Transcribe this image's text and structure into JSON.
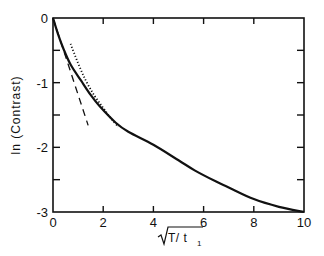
{
  "chart_data": {
    "type": "line",
    "title": "",
    "xlabel": "√(T/t₁)",
    "xlabel_parts": {
      "radicand_main": "T/ t",
      "subscript": "1"
    },
    "ylabel": "ln (Contrast)",
    "xlim": [
      0,
      10
    ],
    "ylim": [
      -3,
      0
    ],
    "x_ticks": [
      0,
      2,
      4,
      6,
      8,
      10
    ],
    "x_tick_labels": [
      "0",
      "2",
      "4",
      "6",
      "8",
      "10"
    ],
    "y_ticks": [
      0,
      -1,
      -2,
      -3
    ],
    "y_tick_labels": [
      "0",
      "-1",
      "-2",
      "-3"
    ],
    "y_minor_ticks": [
      -0.5,
      -1.5,
      -2.5
    ],
    "grid": false,
    "legend": null,
    "series": [
      {
        "name": "full solution",
        "style": "solid",
        "color": "#111111",
        "x": [
          0,
          0.2,
          0.4,
          0.7,
          1.12,
          1.5,
          1.87,
          2.5,
          3.0,
          4.0,
          5.0,
          5.66,
          6.5,
          7.0,
          8.0,
          9.0,
          10.0
        ],
        "y": [
          0,
          -0.25,
          -0.46,
          -0.72,
          -0.97,
          -1.19,
          -1.37,
          -1.62,
          -1.76,
          -1.96,
          -2.2,
          -2.36,
          -2.53,
          -2.62,
          -2.8,
          -2.92,
          -3.0
        ]
      },
      {
        "name": "short-time asymptote",
        "style": "dashed",
        "color": "#111111",
        "x": [
          0,
          1.4
        ],
        "y": [
          0,
          -1.66
        ]
      },
      {
        "name": "long-time asymptote",
        "style": "dotted",
        "color": "#111111",
        "x": [
          0.7,
          1.0,
          1.31,
          1.65,
          2.0,
          2.3,
          2.6
        ],
        "y": [
          -0.4,
          -0.7,
          -0.97,
          -1.2,
          -1.39,
          -1.55,
          -1.68
        ]
      }
    ]
  }
}
